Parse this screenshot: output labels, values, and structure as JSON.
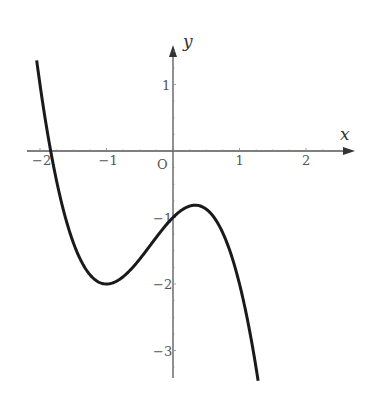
{
  "chart_data": {
    "type": "line",
    "title": "",
    "xlabel": "x",
    "ylabel": "y",
    "origin_label": "O",
    "xlim": [
      -2.05,
      1.28
    ],
    "ylim": [
      -3.4,
      1.4
    ],
    "grid": false,
    "x_ticks": [
      "-2",
      "-1",
      "1",
      "2"
    ],
    "y_ticks": [
      "1",
      "-1",
      "-2",
      "-3"
    ],
    "function": "y = -x^3 - x^2 + x - 1",
    "key_points": [
      {
        "label": "local minimum",
        "x": -1,
        "y": -2
      },
      {
        "label": "local maximum",
        "x": 0.333,
        "y": -0.815
      },
      {
        "label": "y-intercept",
        "x": 0,
        "y": -1
      }
    ],
    "series": [
      {
        "name": "curve",
        "x": [
          -2.05,
          -1.8,
          -1.5,
          -1.25,
          -1,
          -0.75,
          -0.5,
          -0.25,
          0,
          0.333,
          0.6,
          0.9,
          1.1,
          1.28
        ],
        "y": [
          1.36,
          0.0,
          -1.38,
          -1.86,
          -2,
          -1.89,
          -1.63,
          -1.3,
          -1,
          -0.81,
          -0.98,
          -1.82,
          -2.64,
          -3.49
        ]
      }
    ]
  }
}
